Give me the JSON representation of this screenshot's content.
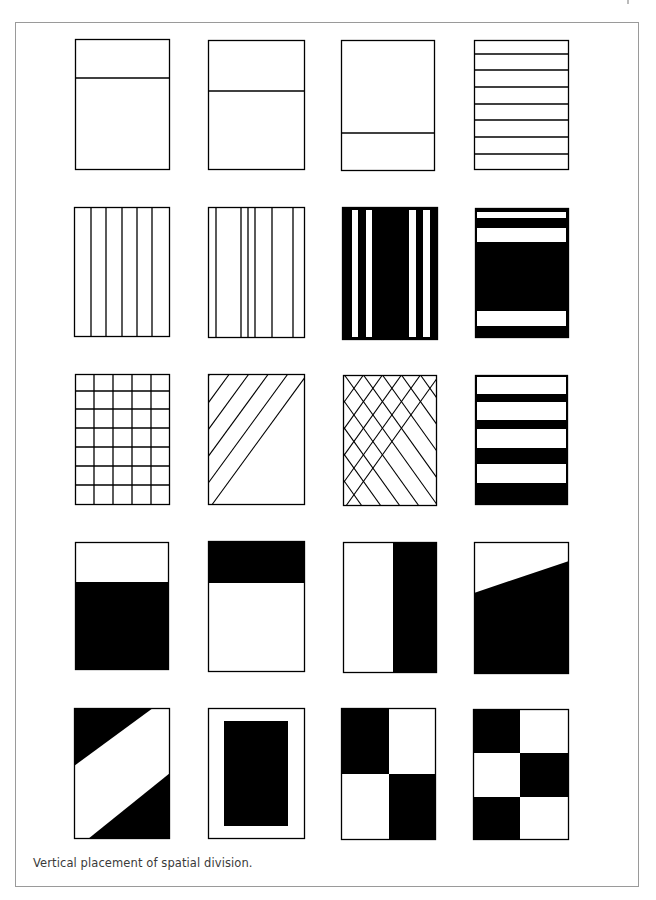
{
  "caption": "Vertical placement of spatial division.",
  "colors": {
    "ink": "#000000",
    "paper": "#ffffff",
    "frame": "#9a9a9a",
    "caption": "#3a3a3a"
  },
  "panels": [
    {
      "id": "p1",
      "desc": "single horizontal division, upper",
      "box": [
        75,
        39,
        95,
        131
      ],
      "lines": [
        [
          75,
          78,
          170,
          78
        ]
      ]
    },
    {
      "id": "p2",
      "desc": "single horizontal division, middle-upper",
      "box": [
        208,
        40,
        97,
        130
      ],
      "lines": [
        [
          208,
          91,
          305,
          91
        ]
      ]
    },
    {
      "id": "p3",
      "desc": "single horizontal division, low",
      "box": [
        341,
        40,
        94,
        131
      ],
      "lines": [
        [
          341,
          133,
          435,
          133
        ]
      ]
    },
    {
      "id": "p4",
      "desc": "equal horizontal bands",
      "box": [
        474,
        40,
        95,
        130
      ],
      "lines": [
        [
          474,
          54,
          569,
          54
        ],
        [
          474,
          70,
          569,
          70
        ],
        [
          474,
          87,
          569,
          87
        ],
        [
          474,
          104,
          569,
          104
        ],
        [
          474,
          120,
          569,
          120
        ],
        [
          474,
          137,
          569,
          137
        ],
        [
          474,
          154,
          569,
          154
        ]
      ]
    },
    {
      "id": "p5",
      "desc": "equal vertical columns",
      "box": [
        74,
        207,
        96,
        130
      ],
      "lines": [
        [
          91,
          207,
          91,
          337
        ],
        [
          106,
          207,
          106,
          337
        ],
        [
          122,
          207,
          122,
          337
        ],
        [
          137,
          207,
          137,
          337
        ],
        [
          152,
          207,
          152,
          337
        ]
      ]
    },
    {
      "id": "p6",
      "desc": "irregular vertical columns",
      "box": [
        208,
        207,
        97,
        131
      ],
      "lines": [
        [
          216,
          207,
          216,
          338
        ],
        [
          241,
          207,
          241,
          338
        ],
        [
          248,
          207,
          248,
          338
        ],
        [
          255,
          207,
          255,
          338
        ],
        [
          272,
          207,
          272,
          338
        ],
        [
          293,
          207,
          293,
          338
        ]
      ]
    },
    {
      "id": "p7",
      "desc": "black field with white vertical stripes",
      "box": [
        342,
        207,
        96,
        133
      ],
      "fill": "black",
      "white_rects": [
        [
          352,
          210,
          6,
          127
        ],
        [
          366,
          210,
          6,
          127
        ],
        [
          409,
          210,
          7,
          127
        ],
        [
          423,
          210,
          7,
          127
        ]
      ]
    },
    {
      "id": "p8",
      "desc": "black field with white horizontal bands",
      "box": [
        475,
        208,
        94,
        130
      ],
      "fill": "black",
      "white_rects": [
        [
          477,
          212,
          89,
          6
        ],
        [
          477,
          228,
          89,
          14
        ],
        [
          477,
          311,
          89,
          15
        ]
      ]
    },
    {
      "id": "p9",
      "desc": "square grid 5x7",
      "box": [
        75,
        374,
        95,
        131
      ],
      "lines": [
        [
          94,
          374,
          94,
          505
        ],
        [
          113,
          374,
          113,
          505
        ],
        [
          132,
          374,
          132,
          505
        ],
        [
          151,
          374,
          151,
          505
        ],
        [
          75,
          391,
          170,
          391
        ],
        [
          75,
          409,
          170,
          409
        ],
        [
          75,
          428,
          170,
          428
        ],
        [
          75,
          447,
          170,
          447
        ],
        [
          75,
          466,
          170,
          466
        ],
        [
          75,
          485,
          170,
          485
        ]
      ]
    },
    {
      "id": "p10",
      "desc": "parallel diagonal hatching",
      "box": [
        208,
        374,
        97,
        131
      ],
      "pattern": "diagonal",
      "spacing": 19.5,
      "slope": 1.37
    },
    {
      "id": "p11",
      "desc": "diamond lattice",
      "box": [
        343,
        375,
        94,
        131
      ],
      "pattern": "lattice",
      "spacing": 19,
      "slope": 1.4
    },
    {
      "id": "p12",
      "desc": "white bands on black, bottom weighted",
      "box": [
        475,
        375,
        93,
        130
      ],
      "fill": "black",
      "white_rects": [
        [
          477,
          377,
          89,
          17
        ],
        [
          477,
          402,
          89,
          18
        ],
        [
          477,
          429,
          89,
          19
        ],
        [
          477,
          464,
          89,
          19
        ]
      ]
    },
    {
      "id": "p13",
      "desc": "black lower field",
      "box": [
        75,
        542,
        94,
        128
      ],
      "black_rects": [
        [
          75,
          582,
          94,
          88
        ]
      ]
    },
    {
      "id": "p14",
      "desc": "black upper band",
      "box": [
        208,
        541,
        97,
        131
      ],
      "black_rects": [
        [
          208,
          541,
          97,
          42
        ]
      ]
    },
    {
      "id": "p15",
      "desc": "vertical split, black right",
      "box": [
        343,
        542,
        94,
        131
      ],
      "black_rects": [
        [
          393,
          542,
          44,
          131
        ]
      ]
    },
    {
      "id": "p16",
      "desc": "slanted division, black lower",
      "box": [
        474,
        542,
        95,
        132
      ],
      "black_polys": [
        [
          [
            474,
            593
          ],
          [
            569,
            561
          ],
          [
            569,
            674
          ],
          [
            474,
            674
          ]
        ]
      ]
    },
    {
      "id": "p17",
      "desc": "diagonal white band across black corners",
      "box": [
        74,
        708,
        96,
        131
      ],
      "black_polys": [
        [
          [
            74,
            708
          ],
          [
            153,
            708
          ],
          [
            74,
            766
          ]
        ],
        [
          [
            170,
            773
          ],
          [
            170,
            839
          ],
          [
            88,
            839
          ]
        ]
      ]
    },
    {
      "id": "p18",
      "desc": "black rectangle centered in white margin",
      "box": [
        208,
        708,
        97,
        131
      ],
      "black_rects": [
        [
          224,
          721,
          64,
          105
        ]
      ]
    },
    {
      "id": "p19",
      "desc": "2x2 checkerboard",
      "box": [
        341,
        708,
        95,
        132
      ],
      "black_rects": [
        [
          341,
          708,
          48,
          66
        ],
        [
          389,
          774,
          47,
          66
        ]
      ]
    },
    {
      "id": "p20",
      "desc": "2x3 checkerboard",
      "box": [
        473,
        709,
        96,
        131
      ],
      "black_rects": [
        [
          473,
          709,
          47,
          44
        ],
        [
          520,
          753,
          49,
          44
        ],
        [
          473,
          797,
          47,
          43
        ]
      ]
    }
  ]
}
